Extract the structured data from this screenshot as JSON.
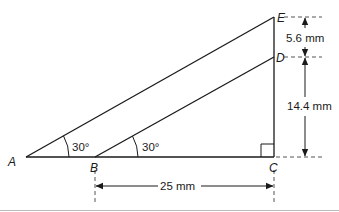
{
  "diagram": {
    "points": {
      "A": {
        "label": "A"
      },
      "B": {
        "label": "B"
      },
      "C": {
        "label": "C"
      },
      "D": {
        "label": "D"
      },
      "E": {
        "label": "E"
      }
    },
    "angles": {
      "at_A": "30°",
      "at_B": "30°"
    },
    "dimensions": {
      "ED": "5.6 mm",
      "DC": "14.4 mm",
      "BC": "25 mm"
    },
    "colors": {
      "line": "#1a1a1a",
      "dashed": "#555555",
      "separator": "#bbbbbb"
    }
  }
}
